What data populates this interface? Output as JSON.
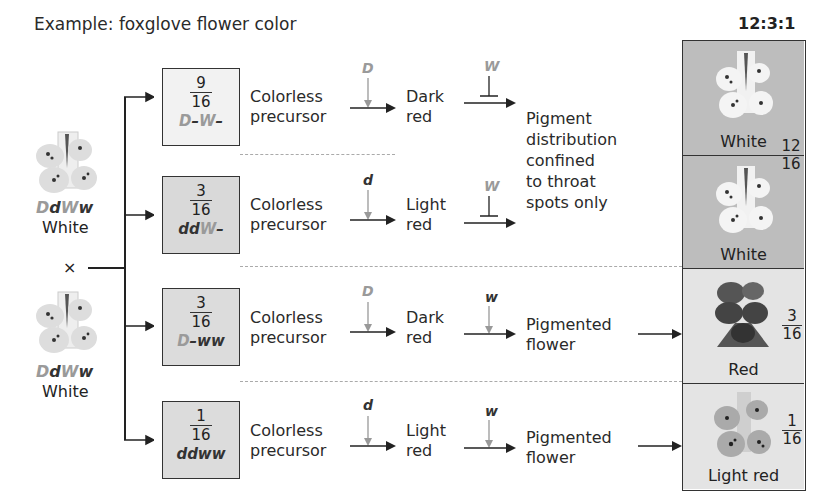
{
  "title": "Example: foxglove flower color",
  "ratio": "12:3:1",
  "parents": [
    {
      "genotype": [
        {
          "t": "D",
          "tone": "light"
        },
        {
          "t": "d",
          "tone": "dark"
        },
        {
          "t": "W",
          "tone": "light"
        },
        {
          "t": "w",
          "tone": "dark"
        }
      ],
      "phenotype": "White"
    },
    {
      "genotype": [
        {
          "t": "D",
          "tone": "light"
        },
        {
          "t": "d",
          "tone": "dark"
        },
        {
          "t": "W",
          "tone": "light"
        },
        {
          "t": "w",
          "tone": "dark"
        }
      ],
      "phenotype": "White"
    }
  ],
  "cross_symbol": "×",
  "rows": [
    {
      "num": "9",
      "den": "16",
      "genotype": [
        {
          "t": "D",
          "tone": "light"
        },
        {
          "t": "–",
          "tone": "dark"
        },
        {
          "t": "W",
          "tone": "light"
        },
        {
          "t": "–",
          "tone": "dark"
        }
      ],
      "box_color": "#f2f2f2",
      "start": "Colorless precursor",
      "enzyme1": "D",
      "enzyme1_tone": "light",
      "mid": "Dark red",
      "enzyme2": "W",
      "enzyme2_tone": "light",
      "enzyme2_type": "inhibit"
    },
    {
      "num": "3",
      "den": "16",
      "genotype": [
        {
          "t": "dd",
          "tone": "dark"
        },
        {
          "t": "W",
          "tone": "light"
        },
        {
          "t": "–",
          "tone": "dark"
        }
      ],
      "box_color": "#d9d9d9",
      "start": "Colorless precursor",
      "enzyme1": "d",
      "enzyme1_tone": "dark",
      "mid": "Light red",
      "enzyme2": "W",
      "enzyme2_tone": "light",
      "enzyme2_type": "inhibit"
    },
    {
      "num": "3",
      "den": "16",
      "genotype": [
        {
          "t": "D",
          "tone": "light"
        },
        {
          "t": "–ww",
          "tone": "dark"
        }
      ],
      "box_color": "#dcdcdc",
      "start": "Colorless precursor",
      "enzyme1": "D",
      "enzyme1_tone": "light",
      "mid": "Dark red",
      "enzyme2": "w",
      "enzyme2_tone": "dark",
      "enzyme2_type": "activate",
      "result": "Pigmented flower"
    },
    {
      "num": "1",
      "den": "16",
      "genotype": [
        {
          "t": "ddww",
          "tone": "dark"
        }
      ],
      "box_color": "#dcdcdc",
      "start": "Colorless precursor",
      "enzyme1": "d",
      "enzyme1_tone": "dark",
      "mid": "Light red",
      "enzyme2": "w",
      "enzyme2_tone": "dark",
      "enzyme2_type": "activate",
      "result": "Pigmented flower"
    }
  ],
  "shared_result": "Pigment distribution confined to throat spots only",
  "shared_result_lines": [
    "Pigment",
    "distribution",
    "confined",
    "to throat",
    "spots only"
  ],
  "phenotypes": [
    {
      "label": "White",
      "bg": "#bdbdbd",
      "flower": "white"
    },
    {
      "label": "White",
      "bg": "#bdbdbd",
      "flower": "white"
    },
    {
      "label": "Red",
      "bg": "#e4e4e4",
      "flower": "red"
    },
    {
      "label": "Light red",
      "bg": "#e4e4e4",
      "flower": "lightred"
    }
  ],
  "phenotype_fractions": [
    {
      "num": "12",
      "den": "16"
    },
    {
      "num": "3",
      "den": "16"
    },
    {
      "num": "1",
      "den": "16"
    }
  ],
  "colors": {
    "light_allele": "#9a9a9a",
    "dark_allele": "#333333",
    "line": "#222222",
    "dash": "#aaaaaa"
  }
}
